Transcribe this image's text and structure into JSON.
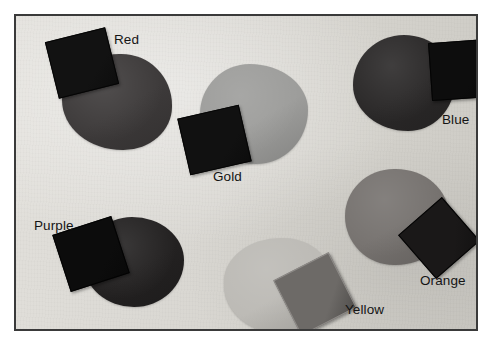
{
  "figure": {
    "kind": "photograph",
    "frame": {
      "border_color": "#3a3a3a",
      "background_color": "#ffffff",
      "paper_color": "#dbd9d4"
    }
  },
  "samples": [
    {
      "name": "red",
      "label": "Red",
      "label_left": 98,
      "label_top": 17,
      "blob": {
        "left": 46,
        "top": 38,
        "width": 110,
        "height": 96,
        "color": "#3d3a3a",
        "radius": "52% 46% 44% 55% / 48% 53% 45% 52%"
      },
      "swatch": {
        "left": 35,
        "top": 18,
        "width": 62,
        "height": 58,
        "rotate": -14,
        "color": "#121212",
        "edge_color": "#050505"
      }
    },
    {
      "name": "gold",
      "label": "Gold",
      "label_left": 197,
      "label_top": 154,
      "blob": {
        "left": 184,
        "top": 48,
        "width": 108,
        "height": 100,
        "color": "#9d9d9b",
        "radius": "46% 54% 48% 52% / 50% 46% 54% 50%"
      },
      "swatch": {
        "left": 167,
        "top": 95,
        "width": 63,
        "height": 58,
        "rotate": -13,
        "color": "#111111",
        "edge_color": "#050505"
      }
    },
    {
      "name": "blue",
      "label": "Blue",
      "label_left": 426,
      "label_top": 97,
      "blob": {
        "left": 337,
        "top": 19,
        "width": 102,
        "height": 96,
        "color": "#2a2828",
        "radius": "50% 50% 46% 54% / 52% 48% 52% 48%"
      },
      "swatch": {
        "left": 414,
        "top": 25,
        "width": 60,
        "height": 58,
        "rotate": -4,
        "color": "#0d0d0d",
        "edge_color": "#040404"
      }
    },
    {
      "name": "purple",
      "label": "Purple",
      "label_left": 18,
      "label_top": 203,
      "blob": {
        "left": 68,
        "top": 201,
        "width": 100,
        "height": 90,
        "color": "#232121",
        "radius": "48% 52% 50% 50% / 52% 48% 52% 48%"
      },
      "swatch": {
        "left": 44,
        "top": 208,
        "width": 62,
        "height": 60,
        "rotate": -18,
        "color": "#0c0c0c",
        "edge_color": "#030303"
      }
    },
    {
      "name": "orange",
      "label": "Orange",
      "label_left": 404,
      "label_top": 258,
      "blob": {
        "left": 329,
        "top": 153,
        "width": 104,
        "height": 96,
        "color": "#76726f",
        "radius": "48% 52% 52% 48% / 50% 50% 48% 52%"
      },
      "swatch": {
        "left": 394,
        "top": 193,
        "width": 58,
        "height": 58,
        "rotate": -41,
        "color": "#1a1818",
        "edge_color": "#050505"
      }
    },
    {
      "name": "yellow",
      "label": "Yellow",
      "label_left": 329,
      "label_top": 287,
      "blob": {
        "left": 208,
        "top": 222,
        "width": 112,
        "height": 96,
        "color": "#bcbab5",
        "radius": "52% 48% 46% 54% / 46% 54% 48% 52%"
      },
      "swatch": {
        "left": 268,
        "top": 247,
        "width": 62,
        "height": 62,
        "rotate": -27,
        "color": "#6d6a67",
        "edge_color": "#8e8b88"
      }
    }
  ]
}
